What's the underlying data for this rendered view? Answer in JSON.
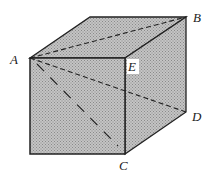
{
  "diagram": {
    "type": "cube",
    "fill_color": "#b8b8b8",
    "stroke_color": "#222222",
    "labels": {
      "A": "A",
      "B": "B",
      "C": "C",
      "D": "D",
      "E": "E"
    },
    "segments": [
      {
        "from": "A",
        "to": "B",
        "style": "dashed"
      },
      {
        "from": "A",
        "to": "C",
        "style": "dashed"
      },
      {
        "from": "A",
        "to": "D",
        "style": "dashed"
      }
    ]
  }
}
